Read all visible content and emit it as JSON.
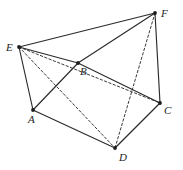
{
  "figure": {
    "width": 183,
    "height": 170,
    "background_color": "#ffffff",
    "line_color": "#2b2b2b",
    "dashed_line_color": "#3a3a3a",
    "vertices": [
      {
        "id": "A",
        "label": "A",
        "x": 33,
        "y": 110,
        "label_x": 28,
        "label_y": 114
      },
      {
        "id": "B",
        "label": "B",
        "x": 78,
        "y": 63,
        "label_x": 80,
        "label_y": 66
      },
      {
        "id": "C",
        "label": "C",
        "x": 160,
        "y": 103,
        "label_x": 164,
        "label_y": 105
      },
      {
        "id": "D",
        "label": "D",
        "x": 115,
        "y": 148,
        "label_x": 119,
        "label_y": 152
      },
      {
        "id": "E",
        "label": "E",
        "x": 19,
        "y": 47,
        "label_x": 6,
        "label_y": 42
      },
      {
        "id": "F",
        "label": "F",
        "x": 155,
        "y": 13,
        "label_x": 161,
        "label_y": 8
      }
    ],
    "edges_solid": [
      {
        "name": "edge-E-F",
        "from": "E",
        "to": "F"
      },
      {
        "name": "edge-E-B",
        "from": "E",
        "to": "B"
      },
      {
        "name": "edge-E-A",
        "from": "E",
        "to": "A"
      },
      {
        "name": "edge-B-F",
        "from": "B",
        "to": "F"
      },
      {
        "name": "edge-B-C",
        "from": "B",
        "to": "C"
      },
      {
        "name": "edge-F-C",
        "from": "F",
        "to": "C"
      },
      {
        "name": "edge-A-B",
        "from": "A",
        "to": "B"
      },
      {
        "name": "edge-A-D",
        "from": "A",
        "to": "D"
      },
      {
        "name": "edge-D-C",
        "from": "D",
        "to": "C"
      }
    ],
    "edges_dashed": [
      {
        "name": "edge-E-D",
        "from": "E",
        "to": "D"
      },
      {
        "name": "edge-E-C",
        "from": "E",
        "to": "C"
      },
      {
        "name": "edge-F-D",
        "from": "F",
        "to": "D"
      }
    ]
  }
}
